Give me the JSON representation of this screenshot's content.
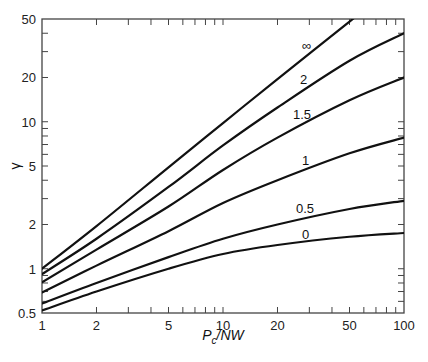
{
  "chart_data": {
    "type": "line",
    "title": "",
    "xlabel": "P_c/NW",
    "xlabel_main": "P",
    "xlabel_sub": "c",
    "xlabel_rest": "/NW",
    "ylabel": "γ",
    "xscale": "log",
    "yscale": "log",
    "xlim": [
      1,
      100
    ],
    "ylim": [
      0.5,
      50
    ],
    "grid": false,
    "legend": "inline curve labels",
    "x_ticks": [
      {
        "value": 1,
        "label": "1"
      },
      {
        "value": 2,
        "label": "2"
      },
      {
        "value": 5,
        "label": "5"
      },
      {
        "value": 10,
        "label": "10"
      },
      {
        "value": 20,
        "label": "20"
      },
      {
        "value": 50,
        "label": "50"
      },
      {
        "value": 100,
        "label": "100"
      }
    ],
    "y_ticks": [
      {
        "value": 0.5,
        "label": "0.5"
      },
      {
        "value": 1,
        "label": "1"
      },
      {
        "value": 2,
        "label": "2"
      },
      {
        "value": 5,
        "label": "5"
      },
      {
        "value": 10,
        "label": "10"
      },
      {
        "value": 20,
        "label": "20"
      },
      {
        "value": 50,
        "label": "50"
      }
    ],
    "x": [
      1,
      2,
      5,
      10,
      20,
      50,
      100
    ],
    "series": [
      {
        "name": "∞",
        "values": [
          1.0,
          1.95,
          4.9,
          9.8,
          19.5,
          48,
          null
        ],
        "label_pos": {
          "x": 302,
          "y": 50
        }
      },
      {
        "name": "2",
        "values": [
          0.92,
          1.6,
          3.6,
          6.9,
          12.5,
          26,
          40
        ],
        "label_pos": {
          "x": 300,
          "y": 84
        }
      },
      {
        "name": "1.5",
        "values": [
          0.81,
          1.35,
          2.65,
          4.7,
          7.8,
          14,
          20
        ],
        "label_pos": {
          "x": 293,
          "y": 119
        }
      },
      {
        "name": "1",
        "values": [
          0.69,
          1.05,
          1.8,
          2.8,
          4.0,
          6.1,
          7.8
        ],
        "label_pos": {
          "x": 302,
          "y": 165
        }
      },
      {
        "name": "0.5",
        "values": [
          0.58,
          0.8,
          1.2,
          1.6,
          2.0,
          2.55,
          2.9
        ],
        "label_pos": {
          "x": 296,
          "y": 213
        }
      },
      {
        "name": "0",
        "values": [
          0.52,
          0.7,
          1.0,
          1.26,
          1.45,
          1.65,
          1.75
        ],
        "label_pos": {
          "x": 302,
          "y": 239
        }
      }
    ]
  },
  "colors": {
    "axis": "#444444",
    "curve": "#111111",
    "text": "#222222"
  }
}
